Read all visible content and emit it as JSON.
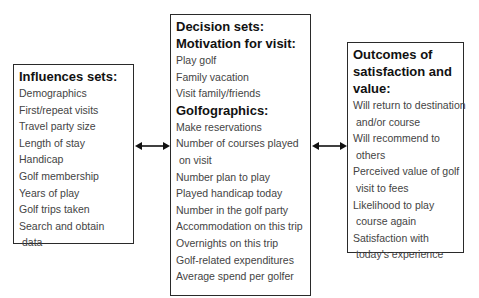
{
  "diagram": {
    "influences": {
      "heading": "Influences sets:",
      "items": [
        {
          "line1": "Demographics"
        },
        {
          "line1": "First/repeat visits"
        },
        {
          "line1": "Travel party size"
        },
        {
          "line1": "Length of stay"
        },
        {
          "line1": "Handicap"
        },
        {
          "line1": "Golf membership"
        },
        {
          "line1": "Years of play"
        },
        {
          "line1": "Golf trips taken"
        },
        {
          "line1": "Search and obtain",
          "line2": "data"
        }
      ]
    },
    "decision": {
      "heading": "Decision sets:",
      "motivation": {
        "heading": "Motivation for visit:",
        "items": [
          {
            "line1": "Play golf"
          },
          {
            "line1": "Family vacation"
          },
          {
            "line1": "Visit family/friends"
          }
        ]
      },
      "golfographics": {
        "heading": "Golfographics:",
        "items": [
          {
            "line1": "Make reservations"
          },
          {
            "line1": "Number of courses played",
            "line2": "on visit"
          },
          {
            "line1": "Number plan to play"
          },
          {
            "line1": "Played handicap today"
          },
          {
            "line1": "Number in the golf party"
          },
          {
            "line1": "Accommodation on this trip"
          },
          {
            "line1": "Overnights on this trip"
          },
          {
            "line1": "Golf-related expenditures"
          },
          {
            "line1": "Average spend per golfer"
          }
        ]
      }
    },
    "outcomes": {
      "heading_lines": [
        "Outcomes of",
        "satisfaction and",
        "value:"
      ],
      "items": [
        {
          "line1": "Will return to destination",
          "line2": "and/or course"
        },
        {
          "line1": "Will recommend to",
          "line2": "others"
        },
        {
          "line1": "Perceived value of golf",
          "line2": "visit to fees"
        },
        {
          "line1": "Likelihood to play",
          "line2": "course again"
        },
        {
          "line1": "Satisfaction with",
          "line2": "today's experience"
        }
      ]
    },
    "connectors": [
      {
        "from": "influences",
        "to": "decision",
        "type": "bidirectional"
      },
      {
        "from": "decision",
        "to": "outcomes",
        "type": "bidirectional"
      }
    ],
    "colors": {
      "border": "#2a2a2a",
      "heading_text": "#111111",
      "body_text": "#444444",
      "arrow": "#111111"
    }
  }
}
